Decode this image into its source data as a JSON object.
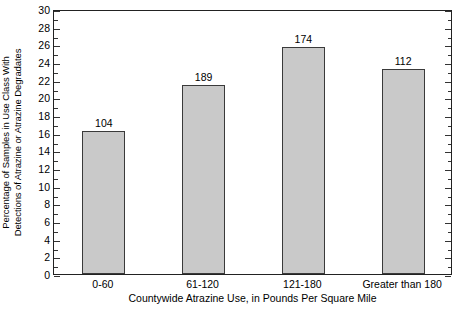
{
  "chart_data": {
    "type": "bar",
    "title": "",
    "categories": [
      "0-60",
      "61-120",
      "121-180",
      "Greater than 180"
    ],
    "values": [
      16.2,
      21.4,
      25.7,
      23.2
    ],
    "bar_labels": [
      "104",
      "189",
      "174",
      "112"
    ],
    "series": [
      {
        "name": "Percentage of Samples in Use Class With Detections of Atrazine or Atrazine Degradates",
        "values": [
          16.2,
          21.4,
          25.7,
          23.2
        ]
      }
    ],
    "xlabel": "Countywide Atrazine Use, in Pounds Per Square Mile",
    "ylabel_line1": "Percentage of Samples in Use Class With",
    "ylabel_line2": "Detections of Atrazine or Atrazine Degradates",
    "ylim": [
      0,
      30
    ],
    "ytick_step": 2,
    "yminor_step": 1,
    "yticks": [
      "0",
      "2",
      "4",
      "6",
      "8",
      "10",
      "12",
      "14",
      "16",
      "18",
      "20",
      "22",
      "24",
      "26",
      "28",
      "30"
    ],
    "grid": false,
    "legend": "none",
    "colors": {
      "bar_fill": "#c9c9c9",
      "bar_border": "#3a3a3a",
      "axis": "#222222",
      "text": "#000000",
      "background": "#ffffff"
    }
  }
}
